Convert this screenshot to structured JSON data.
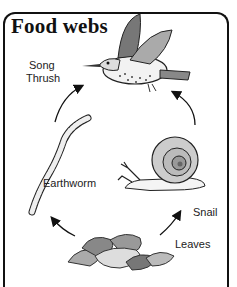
{
  "title": "Food webs",
  "organisms": [
    {
      "id": "song-thrush",
      "label_line1": "Song",
      "label_line2": "Thrush"
    },
    {
      "id": "earthworm",
      "label": "Earthworm"
    },
    {
      "id": "snail",
      "label": "Snail"
    },
    {
      "id": "leaves",
      "label": "Leaves"
    }
  ],
  "arrows": [
    {
      "from": "Leaves",
      "to": "Earthworm"
    },
    {
      "from": "Leaves",
      "to": "Snail"
    },
    {
      "from": "Earthworm",
      "to": "Song Thrush"
    },
    {
      "from": "Snail",
      "to": "Song Thrush"
    }
  ]
}
